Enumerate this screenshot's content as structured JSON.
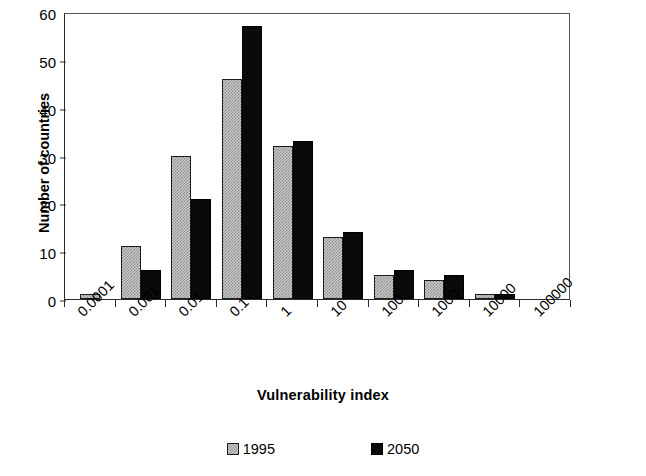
{
  "chart_data": {
    "type": "bar",
    "title": "",
    "xlabel": "Vulnerability index",
    "ylabel": "Number of countries",
    "categories": [
      "0.0001",
      "0.001",
      "0.01",
      "0.1",
      "1",
      "10",
      "100",
      "1000",
      "10000",
      "100000"
    ],
    "series": [
      {
        "name": "1995",
        "color": "#c9c9c9",
        "values": [
          1,
          11,
          30,
          46,
          32,
          13,
          5,
          4,
          1,
          0
        ]
      },
      {
        "name": "2050",
        "color": "#000000",
        "values": [
          0,
          6,
          21,
          57,
          33,
          14,
          6,
          5,
          1,
          0
        ]
      }
    ],
    "ylim": [
      0,
      60
    ],
    "yticks": [
      0,
      10,
      20,
      30,
      40,
      50,
      60
    ],
    "ytick_labels": [
      "0",
      "10",
      "20",
      "30",
      "40",
      "50",
      "60"
    ],
    "grid": false,
    "legend_position": "bottom-center",
    "xtick_rotation": -45
  },
  "legend": {
    "entries": [
      {
        "label": "1995",
        "swatch": "checkered-gray-swatch"
      },
      {
        "label": "2050",
        "swatch": "solid-black-swatch"
      }
    ]
  }
}
